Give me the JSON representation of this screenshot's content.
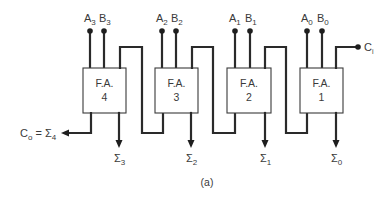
{
  "diagram": {
    "caption": "(a)",
    "adders": [
      {
        "id": "fa4",
        "line1": "F.A.",
        "line2": "4",
        "a_label": "A",
        "a_sub": "3",
        "b_label": "B",
        "b_sub": "3",
        "sum_label": "Σ",
        "sum_sub": "3"
      },
      {
        "id": "fa3",
        "line1": "F.A.",
        "line2": "3",
        "a_label": "A",
        "a_sub": "2",
        "b_label": "B",
        "b_sub": "2",
        "sum_label": "Σ",
        "sum_sub": "2"
      },
      {
        "id": "fa2",
        "line1": "F.A.",
        "line2": "2",
        "a_label": "A",
        "a_sub": "1",
        "b_label": "B",
        "b_sub": "1",
        "sum_label": "Σ",
        "sum_sub": "1"
      },
      {
        "id": "fa1",
        "line1": "F.A.",
        "line2": "1",
        "a_label": "A",
        "a_sub": "0",
        "b_label": "B",
        "b_sub": "0",
        "sum_label": "Σ",
        "sum_sub": "0"
      }
    ],
    "carry_in": {
      "label": "C",
      "sub": "i"
    },
    "carry_out": {
      "label": "C",
      "sub": "o",
      "eq": " = ",
      "sigma": "Σ",
      "sigma_sub": "4"
    },
    "colors": {
      "line": "#2a2a2a",
      "text": "#3a3a3a",
      "box_border": "#3a3a3a",
      "background": "#ffffff"
    }
  }
}
